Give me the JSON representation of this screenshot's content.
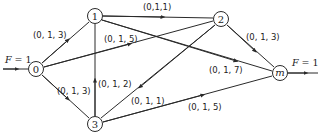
{
  "diagram": {
    "type": "flow-network",
    "nodes": [
      {
        "id": "0",
        "label": "0",
        "x": 36,
        "y": 69
      },
      {
        "id": "1",
        "label": "1",
        "x": 95,
        "y": 16
      },
      {
        "id": "2",
        "label": "2",
        "x": 221,
        "y": 19
      },
      {
        "id": "3",
        "label": "3",
        "x": 95,
        "y": 124
      },
      {
        "id": "m",
        "label": "m",
        "x": 280,
        "y": 73
      }
    ],
    "edges": [
      {
        "from": "0",
        "to": "1",
        "label": "(0, 1, 3)"
      },
      {
        "from": "0",
        "to": "2",
        "label": "(0, 1, 5)"
      },
      {
        "from": "0",
        "to": "3",
        "label": "(0, 1, 3)"
      },
      {
        "from": "1",
        "to": "2",
        "label": "(0,1,1)"
      },
      {
        "from": "1",
        "to": "m",
        "label": "(0, 1, 7)"
      },
      {
        "from": "3",
        "to": "1",
        "label": "(0, 1, 2)"
      },
      {
        "from": "2",
        "to": "3",
        "label": "(0, 1, 1)"
      },
      {
        "from": "2",
        "to": "m",
        "label": "(0, 1, 3)"
      },
      {
        "from": "3",
        "to": "m",
        "label": "(0, 1, 5)"
      }
    ],
    "source_flow": {
      "var": "F",
      "eq": " = 1",
      "node": "0"
    },
    "sink_flow": {
      "var": "F",
      "eq": " = 1",
      "node": "m"
    },
    "colors": {
      "stroke": "#2a2a2a",
      "background": "#ffffff"
    }
  }
}
